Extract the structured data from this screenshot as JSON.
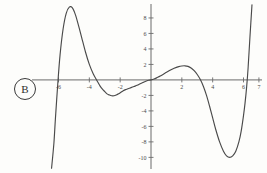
{
  "figure": {
    "panel_label": "B",
    "background_color": "#fdfdfb",
    "curve_color": "#4a4a4a",
    "axis_color": "#6b6b6b"
  },
  "chart_data": {
    "type": "line",
    "title": "",
    "subtitle": "",
    "xlabel": "",
    "ylabel": "",
    "xlim": [
      -7.2,
      7.2
    ],
    "ylim": [
      -11.5,
      9.8
    ],
    "grid": false,
    "legend": null,
    "x_ticks": [
      -6,
      -4,
      -2,
      2,
      4,
      6,
      7
    ],
    "x_tick_labels": [
      "-6",
      "-4",
      "-2",
      "2",
      "4",
      "6",
      "7"
    ],
    "y_ticks": [
      8,
      6,
      4,
      2,
      -2,
      -4,
      -6,
      -8,
      -10
    ],
    "y_tick_labels": [
      "8",
      "6",
      "4",
      "2",
      "-2",
      "-4",
      "-6",
      "-8",
      "-10"
    ],
    "series": [
      {
        "name": "polynomial",
        "x": [
          -6.45,
          -6.3,
          -6.2,
          -6.05,
          -5.9,
          -5.7,
          -5.5,
          -5.3,
          -5.1,
          -4.9,
          -4.7,
          -4.5,
          -4.25,
          -4.0,
          -3.75,
          -3.5,
          -3.3,
          -3.15,
          -3.0,
          -2.85,
          -2.7,
          -2.55,
          -2.4,
          -2.25,
          -2.1,
          -1.95,
          -1.8,
          -1.65,
          -1.5,
          -1.3,
          -1.1,
          -0.9,
          -0.7,
          -0.5,
          -0.3,
          -0.15,
          0,
          0.2,
          0.4,
          0.6,
          0.9,
          1.2,
          1.5,
          1.8,
          2.0,
          2.2,
          2.4,
          2.6,
          2.8,
          3.0,
          3.2,
          3.4,
          3.6,
          3.8,
          4.0,
          4.2,
          4.45,
          4.7,
          4.9,
          5.1,
          5.3,
          5.5,
          5.7,
          5.85,
          6.0,
          6.1,
          6.2,
          6.3,
          6.42,
          6.55
        ],
        "y": [
          -11.4,
          -8.2,
          -5.0,
          -0.6,
          3.2,
          6.6,
          8.6,
          9.4,
          9.3,
          8.4,
          7.0,
          5.5,
          3.6,
          2.0,
          0.8,
          -0.1,
          -0.8,
          -1.2,
          -1.5,
          -1.8,
          -1.95,
          -2.05,
          -2.05,
          -1.95,
          -1.8,
          -1.6,
          -1.4,
          -1.25,
          -1.15,
          -1.0,
          -0.85,
          -0.7,
          -0.5,
          -0.32,
          -0.15,
          -0.05,
          0,
          0.12,
          0.3,
          0.5,
          0.85,
          1.2,
          1.5,
          1.72,
          1.8,
          1.82,
          1.75,
          1.55,
          1.2,
          0.7,
          0.05,
          -0.85,
          -2.0,
          -3.4,
          -4.9,
          -6.4,
          -8.0,
          -9.2,
          -9.8,
          -10.0,
          -9.8,
          -9.2,
          -8.0,
          -6.6,
          -4.6,
          -3.0,
          -1.0,
          1.6,
          5.6,
          9.7
        ]
      }
    ],
    "features": {
      "x_intercepts": [
        -6.2,
        -3.45,
        0,
        3.2,
        6.15
      ],
      "local_maxima": [
        {
          "x": -5.2,
          "y": 9.4
        },
        {
          "x": 2.2,
          "y": 1.82
        }
      ],
      "local_minima": [
        {
          "x": -2.35,
          "y": -2.05
        },
        {
          "x": 5.1,
          "y": -10.0
        }
      ]
    }
  }
}
